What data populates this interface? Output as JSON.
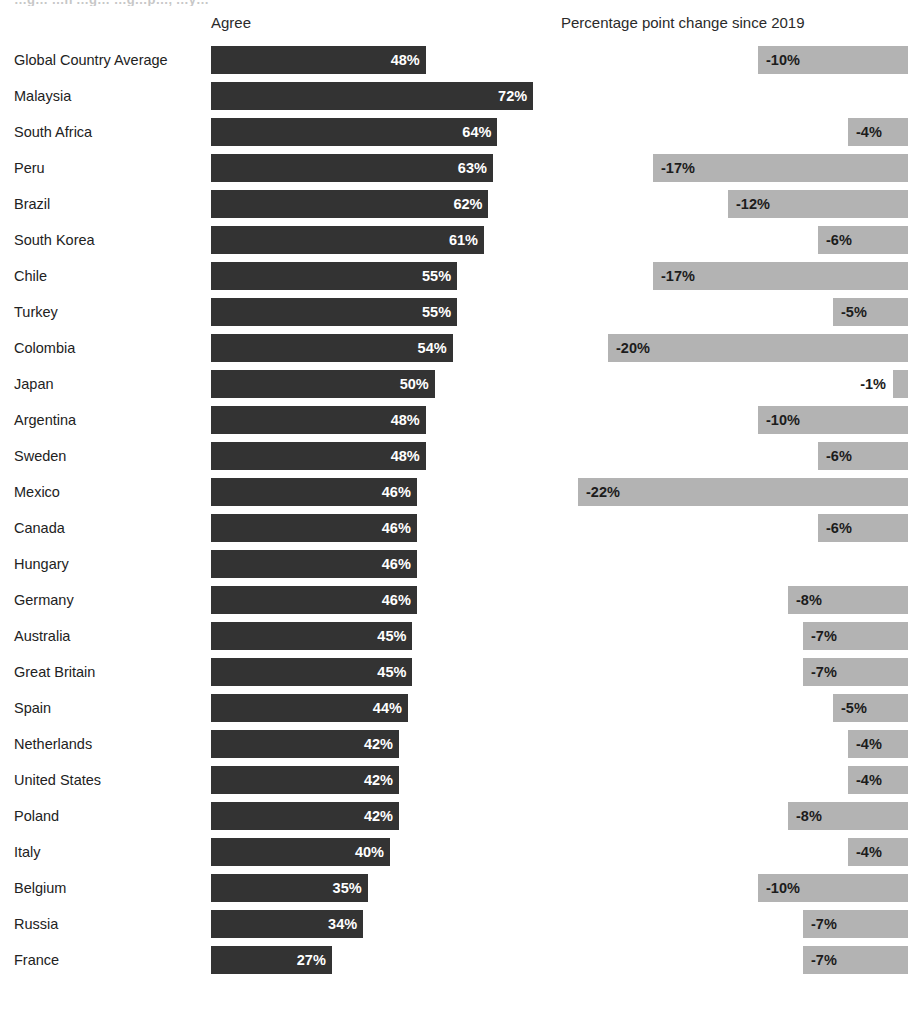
{
  "clipped_title": "…g…  …n …g… …g…p…, …y…",
  "headers": {
    "left": "Agree",
    "right": "Percentage point change since 2019"
  },
  "chart_data": {
    "type": "bar",
    "title": "",
    "subtitle": "",
    "xlabel": "",
    "ylabel": "",
    "orientation": "horizontal",
    "grid": false,
    "legend": null,
    "panels": [
      {
        "name": "agree",
        "header": "Agree",
        "unit": "%",
        "bar_color": "#333333",
        "label_color": "#ffffff",
        "baseline": "left",
        "axis_max": 78
      },
      {
        "name": "change_since_2019",
        "header": "Percentage point change since 2019",
        "unit": "%",
        "bar_color": "#b3b3b3",
        "label_color": "#1c1c1c",
        "baseline": "right",
        "axis_min": -23,
        "axis_max": 0
      }
    ],
    "categories": [
      "Global Country Average",
      "Malaysia",
      "South Africa",
      "Peru",
      "Brazil",
      "South Korea",
      "Chile",
      "Turkey",
      "Colombia",
      "Japan",
      "Argentina",
      "Sweden",
      "Mexico",
      "Canada",
      "Hungary",
      "Germany",
      "Australia",
      "Great Britain",
      "Spain",
      "Netherlands",
      "United States",
      "Poland",
      "Italy",
      "Belgium",
      "Russia",
      "France"
    ],
    "series": [
      {
        "name": "Agree",
        "values": [
          48,
          72,
          64,
          63,
          62,
          61,
          55,
          55,
          54,
          50,
          48,
          48,
          46,
          46,
          46,
          46,
          45,
          45,
          44,
          42,
          42,
          42,
          40,
          35,
          34,
          27
        ]
      },
      {
        "name": "Percentage point change since 2019",
        "values": [
          -10,
          null,
          -4,
          -17,
          -12,
          -6,
          -17,
          -5,
          -20,
          -1,
          -10,
          -6,
          -22,
          -6,
          null,
          -8,
          -7,
          -7,
          -5,
          -4,
          -4,
          -8,
          -4,
          -10,
          -7,
          -7
        ]
      }
    ]
  },
  "rows": [
    {
      "label": "Global Country Average",
      "agree": 48,
      "agree_text": "48%",
      "change": -10,
      "change_text": "-10%"
    },
    {
      "label": "Malaysia",
      "agree": 72,
      "agree_text": "72%",
      "change": null,
      "change_text": ""
    },
    {
      "label": "South Africa",
      "agree": 64,
      "agree_text": "64%",
      "change": -4,
      "change_text": "-4%"
    },
    {
      "label": "Peru",
      "agree": 63,
      "agree_text": "63%",
      "change": -17,
      "change_text": "-17%"
    },
    {
      "label": "Brazil",
      "agree": 62,
      "agree_text": "62%",
      "change": -12,
      "change_text": "-12%"
    },
    {
      "label": "South Korea",
      "agree": 61,
      "agree_text": "61%",
      "change": -6,
      "change_text": "-6%"
    },
    {
      "label": "Chile",
      "agree": 55,
      "agree_text": "55%",
      "change": -17,
      "change_text": "-17%"
    },
    {
      "label": "Turkey",
      "agree": 55,
      "agree_text": "55%",
      "change": -5,
      "change_text": "-5%"
    },
    {
      "label": "Colombia",
      "agree": 54,
      "agree_text": "54%",
      "change": -20,
      "change_text": "-20%"
    },
    {
      "label": "Japan",
      "agree": 50,
      "agree_text": "50%",
      "change": -1,
      "change_text": "-1%"
    },
    {
      "label": "Argentina",
      "agree": 48,
      "agree_text": "48%",
      "change": -10,
      "change_text": "-10%"
    },
    {
      "label": "Sweden",
      "agree": 48,
      "agree_text": "48%",
      "change": -6,
      "change_text": "-6%"
    },
    {
      "label": "Mexico",
      "agree": 46,
      "agree_text": "46%",
      "change": -22,
      "change_text": "-22%"
    },
    {
      "label": "Canada",
      "agree": 46,
      "agree_text": "46%",
      "change": -6,
      "change_text": "-6%"
    },
    {
      "label": "Hungary",
      "agree": 46,
      "agree_text": "46%",
      "change": null,
      "change_text": ""
    },
    {
      "label": "Germany",
      "agree": 46,
      "agree_text": "46%",
      "change": -8,
      "change_text": "-8%"
    },
    {
      "label": "Australia",
      "agree": 45,
      "agree_text": "45%",
      "change": -7,
      "change_text": "-7%"
    },
    {
      "label": "Great Britain",
      "agree": 45,
      "agree_text": "45%",
      "change": -7,
      "change_text": "-7%"
    },
    {
      "label": "Spain",
      "agree": 44,
      "agree_text": "44%",
      "change": -5,
      "change_text": "-5%"
    },
    {
      "label": "Netherlands",
      "agree": 42,
      "agree_text": "42%",
      "change": -4,
      "change_text": "-4%"
    },
    {
      "label": "United States",
      "agree": 42,
      "agree_text": "42%",
      "change": -4,
      "change_text": "-4%"
    },
    {
      "label": "Poland",
      "agree": 42,
      "agree_text": "42%",
      "change": -8,
      "change_text": "-8%"
    },
    {
      "label": "Italy",
      "agree": 40,
      "agree_text": "40%",
      "change": -4,
      "change_text": "-4%"
    },
    {
      "label": "Belgium",
      "agree": 35,
      "agree_text": "35%",
      "change": -10,
      "change_text": "-10%"
    },
    {
      "label": "Russia",
      "agree": 34,
      "agree_text": "34%",
      "change": -7,
      "change_text": "-7%"
    },
    {
      "label": "France",
      "agree": 27,
      "agree_text": "27%",
      "change": -7,
      "change_text": "-7%"
    }
  ],
  "colors": {
    "agree_bar": "#333333",
    "change_bar": "#b3b3b3",
    "background": "#ffffff",
    "text": "#1c1c1c"
  }
}
